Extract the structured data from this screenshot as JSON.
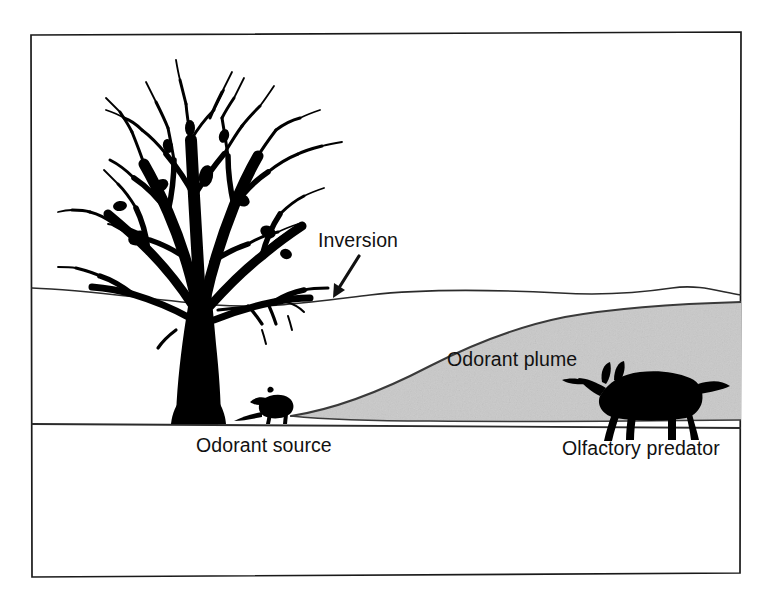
{
  "figure": {
    "background_color": "#ffffff",
    "border_color": "#1a1a1a",
    "ink_color": "#000000",
    "plume_fill_color": "#c9c9c9",
    "plume_edge_color": "#3a3a3a",
    "line_color": "#2b2b2b"
  },
  "labels": {
    "inversion": "Inversion",
    "odorant_plume": "Odorant plume",
    "odorant_source": "Odorant source",
    "olfactory_predator": "Olfactory predator"
  },
  "annotations": {
    "inversion_arrow": "arrow-pointing-down-left-to-inversion-layer"
  },
  "elements": {
    "tree": "bare-deciduous-tree-silhouette",
    "source_animal": "small-mammal-silhouette-odorant-source",
    "predator_animal": "fox-silhouette-olfactory-predator",
    "ground": "ground-line",
    "inversion_layer": "inversion-boundary-line",
    "plume": "shaded-odorant-plume-region"
  },
  "geometry": {
    "frame": {
      "left": 31,
      "top": 32,
      "right": 741,
      "bottom": 574
    },
    "ground_line_y": 424,
    "inversion_line_left_y": 288,
    "inversion_line_right_y": 296,
    "plume_origin_x": 290,
    "plume_origin_y": 416,
    "plume_top_right_y": 306
  }
}
